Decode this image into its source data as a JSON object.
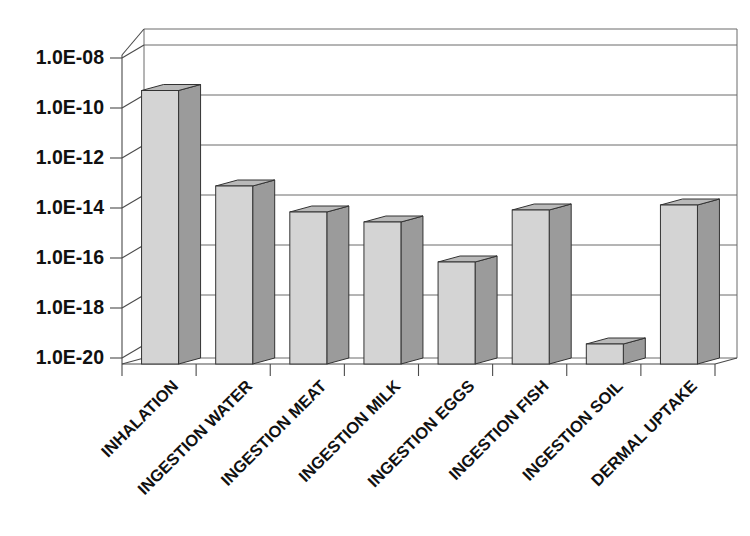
{
  "chart_data": {
    "type": "bar",
    "title": "",
    "subtitle": "",
    "xlabel": "",
    "ylabel": "",
    "style": "3d-column",
    "grid": true,
    "legend": null,
    "yscale": "log",
    "ylim": [
      1e-20,
      1e-08
    ],
    "ytick_labels": [
      "1.0E-08",
      "1.0E-10",
      "1.0E-12",
      "1.0E-14",
      "1.0E-16",
      "1.0E-18",
      "1.0E-20"
    ],
    "ytick_values": [
      1e-08,
      1e-10,
      1e-12,
      1e-14,
      1e-16,
      1e-18,
      1e-20
    ],
    "categories": [
      "INHALATION",
      "INGESTION WATER",
      "INGESTION MEAT",
      "INGESTION MILK",
      "INGESTION EGGS",
      "INGESTION FISH",
      "INGESTION SOIL",
      "DERMAL UPTAKE"
    ],
    "values": [
      5e-10,
      8e-14,
      7e-15,
      2.5e-15,
      7e-17,
      8e-15,
      4e-20,
      1.2e-14
    ],
    "value_exponents": [
      -9.3,
      -13.12,
      -14.16,
      -14.56,
      -16.16,
      -14.08,
      -19.44,
      -13.88
    ],
    "colors": {
      "bar_front": "#d4d4d4",
      "bar_side": "#9b9b9b",
      "bar_top": "#b9b9b9",
      "bar_outline": "#333333",
      "grid": "#6a6a6a",
      "axis": "#4a4a4a",
      "text": "#111111",
      "background": "#ffffff"
    }
  }
}
